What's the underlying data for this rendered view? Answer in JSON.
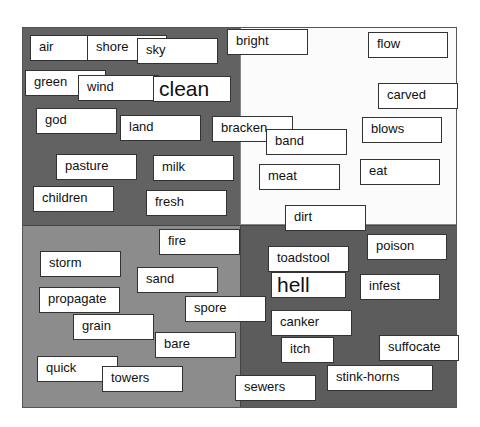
{
  "diagram": {
    "type": "word-sort-quadrants",
    "colors": {
      "top_left": "#626262",
      "top_right": "#fbfbfb",
      "bottom_left": "#8c8c8c",
      "bottom_right": "#5c5c5c",
      "card": "#ffffff"
    },
    "words": [
      {
        "text": "air",
        "x": 30,
        "y": 35,
        "w": 62
      },
      {
        "text": "shore",
        "x": 87,
        "y": 35,
        "w": 80
      },
      {
        "text": "sky",
        "x": 137,
        "y": 38,
        "w": 81
      },
      {
        "text": "bright",
        "x": 227,
        "y": 29,
        "w": 81
      },
      {
        "text": "flow",
        "x": 368,
        "y": 32,
        "w": 80
      },
      {
        "text": "green",
        "x": 25,
        "y": 70,
        "w": 81
      },
      {
        "text": "wind",
        "x": 78,
        "y": 75,
        "w": 81
      },
      {
        "text": "clean",
        "x": 153,
        "y": 76,
        "w": 78,
        "big": true
      },
      {
        "text": "carved",
        "x": 378,
        "y": 83,
        "w": 80
      },
      {
        "text": "god",
        "x": 36,
        "y": 108,
        "w": 81
      },
      {
        "text": "land",
        "x": 120,
        "y": 115,
        "w": 81
      },
      {
        "text": "bracken",
        "x": 212,
        "y": 116,
        "w": 81
      },
      {
        "text": "band",
        "x": 266,
        "y": 129,
        "w": 81
      },
      {
        "text": "blows",
        "x": 362,
        "y": 117,
        "w": 80
      },
      {
        "text": "pasture",
        "x": 56,
        "y": 154,
        "w": 81
      },
      {
        "text": "milk",
        "x": 153,
        "y": 155,
        "w": 81
      },
      {
        "text": "meat",
        "x": 259,
        "y": 164,
        "w": 81
      },
      {
        "text": "eat",
        "x": 360,
        "y": 159,
        "w": 80
      },
      {
        "text": "children",
        "x": 33,
        "y": 186,
        "w": 81
      },
      {
        "text": "fresh",
        "x": 146,
        "y": 190,
        "w": 81
      },
      {
        "text": "dirt",
        "x": 285,
        "y": 205,
        "w": 81
      },
      {
        "text": "fire",
        "x": 159,
        "y": 229,
        "w": 81
      },
      {
        "text": "poison",
        "x": 367,
        "y": 234,
        "w": 80
      },
      {
        "text": "storm",
        "x": 40,
        "y": 251,
        "w": 81
      },
      {
        "text": "toadstool",
        "x": 268,
        "y": 246,
        "w": 81
      },
      {
        "text": "sand",
        "x": 137,
        "y": 267,
        "w": 81
      },
      {
        "text": "hell",
        "x": 271,
        "y": 272,
        "w": 75,
        "big": true
      },
      {
        "text": "infest",
        "x": 360,
        "y": 274,
        "w": 80
      },
      {
        "text": "propagate",
        "x": 39,
        "y": 287,
        "w": 81
      },
      {
        "text": "spore",
        "x": 185,
        "y": 296,
        "w": 81
      },
      {
        "text": "grain",
        "x": 73,
        "y": 314,
        "w": 81
      },
      {
        "text": "canker",
        "x": 271,
        "y": 310,
        "w": 81
      },
      {
        "text": "bare",
        "x": 155,
        "y": 332,
        "w": 81
      },
      {
        "text": "itch",
        "x": 281,
        "y": 337,
        "w": 53
      },
      {
        "text": "suffocate",
        "x": 379,
        "y": 335,
        "w": 80
      },
      {
        "text": "quick",
        "x": 37,
        "y": 356,
        "w": 81
      },
      {
        "text": "towers",
        "x": 102,
        "y": 366,
        "w": 81
      },
      {
        "text": "stink-horns",
        "x": 327,
        "y": 365,
        "w": 106
      },
      {
        "text": "sewers",
        "x": 235,
        "y": 375,
        "w": 81
      }
    ]
  }
}
